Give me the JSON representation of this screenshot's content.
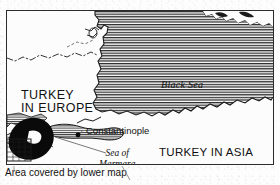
{
  "figure": {
    "type": "historical-map",
    "region": "Black Sea and Turkish Straits"
  },
  "map": {
    "labels": {
      "turkey_in_europe": "TURKEY\nIN EUROPE",
      "turkey_in_europe_line1": "TURKEY",
      "turkey_in_europe_line2": "IN EUROPE",
      "turkey_in_asia": "TURKEY IN ASIA",
      "black_sea": "Black Sea",
      "constantinople": "Constantinople",
      "sea_of_marmara_line1": "Sea of",
      "sea_of_marmara_line2": "Marmara"
    },
    "markers": {
      "constantinople_dot": "city-dot"
    },
    "features": {
      "sea_fill": "horizontal-hatching",
      "boundary_style": "dash-dot",
      "inset_area_fill": "solid-black"
    },
    "colors": {
      "ink": "#111111",
      "frame": "#2b2b2b",
      "land": "#fcfcfc",
      "sea_hatch": "#2a2a2a",
      "paper": "#fdfdfd"
    }
  },
  "caption": {
    "text": "Area covered by lower map"
  }
}
